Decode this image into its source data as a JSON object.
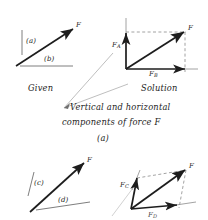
{
  "figure": {
    "caption_line1": "Vertical and horizontal",
    "caption_line2": "components of force F",
    "caption_number": "(a)",
    "panels": [
      {
        "id": "given-top",
        "title": "Given",
        "labels": [
          {
            "name": "axis-label-a",
            "text": "(a)"
          },
          {
            "name": "axis-label-b",
            "text": "(b)"
          },
          {
            "name": "force-label-f",
            "text": "F"
          }
        ]
      },
      {
        "id": "solution-top",
        "title": "Solution",
        "labels": [
          {
            "name": "force-label-fa",
            "text": "F",
            "sub": "A"
          },
          {
            "name": "force-label-fb",
            "text": "F",
            "sub": "B"
          },
          {
            "name": "force-label-f",
            "text": "F"
          }
        ]
      },
      {
        "id": "given-bottom",
        "title": "",
        "labels": [
          {
            "name": "axis-label-c",
            "text": "(c)"
          },
          {
            "name": "axis-label-d",
            "text": "(d)"
          },
          {
            "name": "force-label-f",
            "text": "F"
          }
        ]
      },
      {
        "id": "solution-bottom",
        "title": "",
        "labels": [
          {
            "name": "force-label-fc",
            "text": "F",
            "sub": "C"
          },
          {
            "name": "force-label-fd",
            "text": "F",
            "sub": "D"
          },
          {
            "name": "force-label-f",
            "text": "F"
          }
        ]
      }
    ],
    "colors": {
      "ink": "#1d1d1d",
      "construction": "#8c8c8c",
      "leader": "#a8a8a8",
      "background": "#ffffff"
    }
  }
}
